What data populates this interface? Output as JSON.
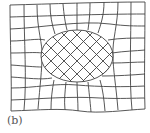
{
  "figure": {
    "label": "(b)",
    "line_color": "#444444",
    "background": "#ffffff"
  },
  "grid": {
    "outer": {
      "left": 10,
      "right": 145,
      "top": 4,
      "bottom": 111
    },
    "columns": 10,
    "rows": 9
  },
  "inclusion": {
    "shape": "ellipse",
    "cx": 77,
    "cy": 56,
    "rx": 36,
    "ry": 26,
    "inner_grid_angle_deg": 45,
    "inner_grid_spacing": 13
  }
}
